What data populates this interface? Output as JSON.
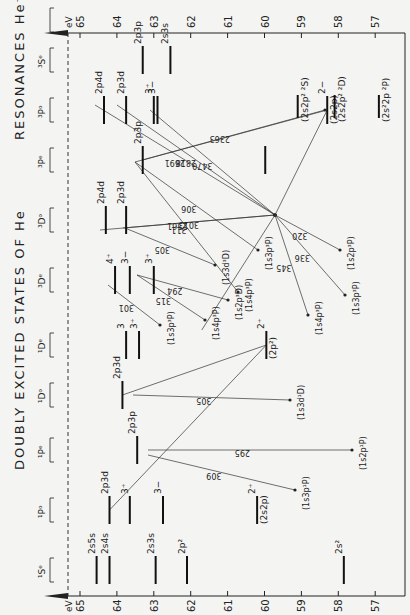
{
  "title": "DOUBLY EXCITED STATES OF He",
  "title2": "RESONANCES He⁻",
  "axis": {
    "unit": "eV",
    "ticks": [
      65,
      64,
      63,
      62,
      61,
      60,
      59,
      58,
      57
    ],
    "tick_labels": [
      "65",
      "64",
      "63",
      "62",
      "61",
      "60",
      "59",
      "58",
      "57"
    ]
  },
  "columns": [
    {
      "label": "¹Sᵉ",
      "y": 570
    },
    {
      "label": "¹Pᵒ",
      "y": 510
    },
    {
      "label": "¹Pᵉ",
      "y": 450
    },
    {
      "label": "¹Dᵒ",
      "y": 395
    },
    {
      "label": "¹Dᵉ",
      "y": 345
    },
    {
      "label": "³Dᵉ",
      "y": 280
    },
    {
      "label": "³Dᵒ",
      "y": 220
    },
    {
      "label": "³Pᵉ",
      "y": 160
    },
    {
      "label": "³Pᵒ",
      "y": 110
    },
    {
      "label": "³Sᵉ",
      "y": 60
    },
    {
      "label": "",
      "y": 20
    }
  ],
  "levels": [
    {
      "col": 0,
      "E": 64.55,
      "label": "2s5s"
    },
    {
      "col": 0,
      "E": 64.2,
      "label": "2s4s"
    },
    {
      "col": 0,
      "E": 62.95,
      "label": "2s3s"
    },
    {
      "col": 0,
      "E": 62.1,
      "label": "2p²"
    },
    {
      "col": 0,
      "E": 57.85,
      "label": "2s²"
    },
    {
      "col": 1,
      "E": 64.2,
      "label": "2p3d"
    },
    {
      "col": 1,
      "E": 63.65,
      "label": "3⁺"
    },
    {
      "col": 1,
      "E": 62.75,
      "label": "3−"
    },
    {
      "col": 1,
      "E": 60.2,
      "label": "2⁺",
      "sub": "(2s2p)"
    },
    {
      "col": 2,
      "E": 63.45,
      "label": "2p3p"
    },
    {
      "col": 3,
      "E": 63.85,
      "label": "2p3d"
    },
    {
      "col": 4,
      "E": 63.75,
      "label": "3"
    },
    {
      "col": 4,
      "E": 63.4,
      "label": "3⁺"
    },
    {
      "col": 4,
      "E": 59.95,
      "label": "2⁺",
      "sub": "(2p²)"
    },
    {
      "col": 5,
      "E": 64.05,
      "label": "4⁺"
    },
    {
      "col": 5,
      "E": 63.65,
      "label": "3−"
    },
    {
      "col": 5,
      "E": 63.0,
      "label": "3⁺"
    },
    {
      "col": 6,
      "E": 64.3,
      "label": "2p4d"
    },
    {
      "col": 6,
      "E": 63.75,
      "label": "2p3d"
    },
    {
      "col": 7,
      "E": 63.3,
      "label": "2p3p"
    },
    {
      "col": 7,
      "E": 59.98,
      "label": ""
    },
    {
      "col": 8,
      "E": 64.35,
      "label": "2p4d"
    },
    {
      "col": 8,
      "E": 63.75,
      "label": "2p3d"
    },
    {
      "col": 8,
      "E": 63.0,
      "label": "3⁺"
    },
    {
      "col": 8,
      "E": 62.9,
      "label": "3−"
    },
    {
      "col": 8,
      "E": 58.3,
      "label": "2−",
      "sub": "(2s2p)"
    },
    {
      "col": 9,
      "E": 63.3,
      "label": "2p3p"
    },
    {
      "col": 9,
      "E": 62.55,
      "label": "2s3s"
    }
  ],
  "resonances": [
    {
      "label": "(2s2p² ²S)",
      "E": 59.1
    },
    {
      "label": "(2s2p² ²D)",
      "E": 58.1
    },
    {
      "label": "(2s²2p ²P)",
      "E": 56.9
    }
  ],
  "transitions": [
    {
      "label": "309",
      "target": "(1s3p¹P)"
    },
    {
      "label": "295",
      "target": "(1s2p¹P)"
    },
    {
      "label": "305",
      "target": "(1s3d¹D)"
    },
    {
      "label": "301",
      "target": "(1s3p³P)"
    },
    {
      "label": "315",
      "target": "(1s4p³P)"
    },
    {
      "label": "294",
      "target": "(1s2p³D)"
    },
    {
      "label": "305",
      "target": "(1s3d³D)"
    },
    {
      "label": "311",
      "target": "(1s4p³P)"
    },
    {
      "label": "306",
      "target": "(1s3p³P)"
    },
    {
      "label": "2561",
      "target": ""
    },
    {
      "label": "3013",
      "target": ""
    },
    {
      "label": "2363",
      "target": ""
    },
    {
      "label": "2691",
      "target": ""
    },
    {
      "label": "2818",
      "target": ""
    },
    {
      "label": "3470",
      "target": ""
    },
    {
      "label": "320",
      "target": "(1s2p³P)"
    },
    {
      "label": "336",
      "target": "(1s3p³P)"
    },
    {
      "label": "345",
      "target": "(1s4p³P)"
    }
  ]
}
